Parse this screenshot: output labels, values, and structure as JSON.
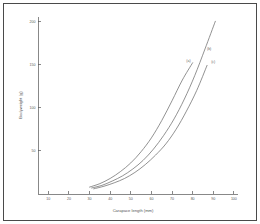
{
  "figure": {
    "background_color": "#ffffff",
    "frame_color": "#4a4a4a",
    "axis_color": "#555555",
    "curve_color": "#6e6e6e"
  },
  "chart_data": {
    "type": "line",
    "title": "",
    "subtitle": "",
    "xlabel": "Carapace length  (mm)",
    "ylabel": "Bodyweight  (g)",
    "xlim": [
      5,
      102
    ],
    "ylim": [
      0,
      205
    ],
    "xticks": [
      10,
      20,
      30,
      40,
      50,
      60,
      70,
      80,
      90,
      100
    ],
    "xticklabels": [
      "10",
      "20",
      "30",
      "40",
      "50",
      "60",
      "70",
      "80",
      "90",
      "100"
    ],
    "yticks": [
      50,
      100,
      150,
      200
    ],
    "yticklabels": [
      "50",
      "100",
      "150",
      "200"
    ],
    "grid": false,
    "legend_position": "inline-curve-labels",
    "series": [
      {
        "name": "(a)",
        "label": "(a)",
        "label_x": 78,
        "label_y": 152,
        "x": [
          30,
          35,
          40,
          45,
          50,
          55,
          60,
          65,
          70,
          75,
          80
        ],
        "y": [
          8,
          12,
          18,
          26,
          36,
          49,
          65,
          85,
          108,
          132,
          152
        ]
      },
      {
        "name": "(b)",
        "label": "(b)",
        "label_x": 88,
        "label_y": 166,
        "x": [
          31,
          36,
          41,
          46,
          51,
          56,
          61,
          66,
          71,
          76,
          81,
          86,
          91
        ],
        "y": [
          7,
          10,
          15,
          21,
          29,
          39,
          52,
          68,
          87,
          110,
          137,
          168,
          200
        ]
      },
      {
        "name": "(c)",
        "label": "(c)",
        "label_x": 90,
        "label_y": 150,
        "x": [
          32,
          37,
          42,
          47,
          52,
          57,
          62,
          67,
          72,
          77,
          82,
          87
        ],
        "y": [
          6,
          9,
          13,
          18,
          25,
          34,
          45,
          58,
          75,
          96,
          120,
          149
        ]
      }
    ]
  }
}
